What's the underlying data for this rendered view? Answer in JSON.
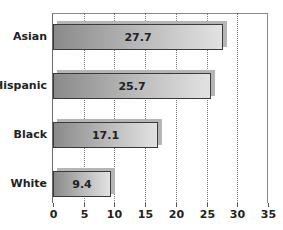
{
  "chart_data": {
    "type": "bar",
    "orientation": "horizontal",
    "title": "",
    "xlabel": "",
    "ylabel": "",
    "categories": [
      "Asian",
      "Hispanic",
      "Black",
      "White"
    ],
    "values": [
      27.7,
      25.7,
      17.1,
      9.4
    ],
    "data_labels": [
      "27.7",
      "25.7",
      "17.1",
      "9.4"
    ],
    "xlim": [
      0,
      35
    ],
    "x_ticks": [
      "0",
      "5",
      "10",
      "15",
      "20",
      "25",
      "30",
      "35"
    ],
    "grid": "vertical dotted",
    "legend": "none"
  }
}
